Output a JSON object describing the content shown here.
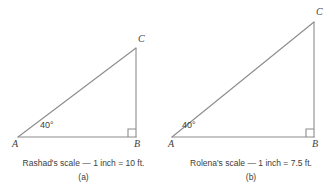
{
  "figure": {
    "background_color": "#ffffff",
    "stroke_color": "#8c8c8c",
    "text_color": "#3d3d3d"
  },
  "panels": [
    {
      "id": "a",
      "sublabel": "(a)",
      "caption": "Rashad's scale — 1 inch = 10 ft.",
      "scale_owner": "Rashad",
      "scale_inches": "1 inch",
      "scale_feet": "10 ft.",
      "angle_label": "40°",
      "vertices": {
        "a_label": "A",
        "b_label": "B",
        "c_label": "C"
      },
      "geometry": {
        "ax": 18,
        "ay": 137,
        "bx": 136,
        "by": 137,
        "cx": 136,
        "cy": 48,
        "right_angle_size": 8
      }
    },
    {
      "id": "b",
      "sublabel": "(b)",
      "caption": "Rolena's scale — 1 inch = 7.5 ft.",
      "scale_owner": "Rolena",
      "scale_inches": "1 inch",
      "scale_feet": "7.5 ft.",
      "angle_label": "40°",
      "vertices": {
        "a_label": "A",
        "b_label": "B",
        "c_label": "C"
      },
      "geometry": {
        "ax": 5,
        "ay": 137,
        "bx": 147,
        "by": 137,
        "cx": 147,
        "cy": 22,
        "right_angle_size": 8
      }
    }
  ]
}
